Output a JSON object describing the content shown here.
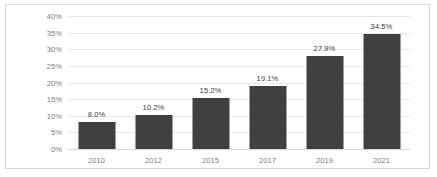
{
  "chart_data": {
    "type": "bar",
    "title": "",
    "subtitle": "",
    "xlabel": "",
    "ylabel": "",
    "categories": [
      "2010",
      "2012",
      "2015",
      "2017",
      "2019",
      "2021"
    ],
    "values": [
      8.0,
      10.2,
      15.2,
      19.1,
      27.9,
      34.5
    ],
    "value_labels": [
      "8.0%",
      "10.2%",
      "15.2%",
      "19.1%",
      "27.9%",
      "34.5%"
    ],
    "ylim": [
      0,
      40
    ],
    "ytick_values": [
      0,
      5,
      10,
      15,
      20,
      25,
      30,
      35,
      40
    ],
    "ytick_labels": [
      "0%",
      "5%",
      "10%",
      "15%",
      "20%",
      "25%",
      "30%",
      "35%",
      "40%"
    ],
    "grid": true,
    "legend": null,
    "legend_position": "none",
    "series": [
      {
        "name": "",
        "values": [
          8.0,
          10.2,
          15.2,
          19.1,
          27.9,
          34.5
        ]
      }
    ],
    "colors": {
      "bar": "#404040",
      "gridline": "#e8e8e8",
      "axis": "#d9d9d9",
      "tick_text": "#808080",
      "label_text": "#404040",
      "frame_border": "#d9d9d9",
      "background": "#ffffff"
    }
  }
}
